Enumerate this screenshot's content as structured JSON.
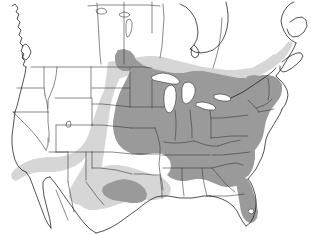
{
  "figure": {
    "type": "range-map",
    "region": "North America",
    "width": 311,
    "height": 235,
    "background_color": "#ffffff",
    "has_legend": false,
    "has_title": false,
    "has_axis_labels": false,
    "has_border_frame": false
  },
  "chart_data": {
    "type": "map",
    "title": "",
    "subtitle": "",
    "xlabel": "",
    "ylabel": "",
    "projection_extent": "North America: Pacific coast to Atlantic coast, northern Mexico to Hudson Bay",
    "grid": false,
    "legend_position": "none",
    "shading_classes": [
      {
        "key": "primary",
        "label": "Core range",
        "color": "#9a9a9a",
        "description": "Solid dark-gray fill covering the eastern and central United States"
      },
      {
        "key": "secondary",
        "label": "Peripheral range",
        "color": "#d6d6d6",
        "description": "Light-gray fill along southern Canada, the Great Plains, Texas and the desert Southwest"
      },
      {
        "key": "absent",
        "label": "Outside range",
        "color": "#ffffff",
        "description": "Unshaded white: western mountain states, most of Canada, Mexico, oceans and lakes"
      }
    ],
    "regions": [
      {
        "name": "Northeastern United States",
        "class": "primary"
      },
      {
        "name": "Mid-Atlantic United States",
        "class": "primary"
      },
      {
        "name": "Southeastern United States",
        "class": "primary"
      },
      {
        "name": "Florida peninsula",
        "class": "primary"
      },
      {
        "name": "Great Lakes states",
        "class": "primary"
      },
      {
        "name": "Ohio and Mississippi valleys",
        "class": "primary"
      },
      {
        "name": "Eastern Great Plains",
        "class": "primary"
      },
      {
        "name": "Central Texas",
        "class": "primary"
      },
      {
        "name": "Southern Manitoba",
        "class": "primary"
      },
      {
        "name": "Southern Ontario and Quebec",
        "class": "secondary"
      },
      {
        "name": "New Brunswick and Nova Scotia",
        "class": "secondary"
      },
      {
        "name": "Western Great Plains",
        "class": "secondary"
      },
      {
        "name": "Texas and Gulf Coastal Plain",
        "class": "secondary"
      },
      {
        "name": "New Mexico and Arizona",
        "class": "secondary"
      },
      {
        "name": "Southern California",
        "class": "secondary"
      },
      {
        "name": "Pacific Northwest",
        "class": "absent"
      },
      {
        "name": "Northern Rocky Mountains",
        "class": "absent"
      },
      {
        "name": "Great Basin",
        "class": "absent"
      },
      {
        "name": "Northern and central Canada",
        "class": "absent"
      },
      {
        "name": "Mexico south of the border",
        "class": "absent"
      }
    ],
    "water_bodies": [
      "Lake Superior",
      "Lake Michigan",
      "Lake Huron",
      "Lake Erie",
      "Lake Ontario",
      "Lake Winnipeg",
      "Lake Athabasca",
      "Great Slave Lake",
      "Great Salt Lake",
      "Lake Okeechobee",
      "Hudson Bay",
      "Atlantic Ocean",
      "Pacific Ocean",
      "Gulf of Mexico",
      "Gulf of California"
    ],
    "annotations": []
  }
}
